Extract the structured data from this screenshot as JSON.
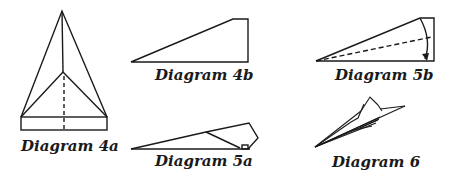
{
  "diagrams": [
    {
      "id": "4a",
      "caption": "Diagram 4a"
    },
    {
      "id": "4b",
      "caption": "Diagram 4b"
    },
    {
      "id": "5a",
      "caption": "Diagram 5a"
    },
    {
      "id": "5b",
      "caption": "Diagram 5b"
    },
    {
      "id": "6",
      "caption": "Diagram 6"
    }
  ],
  "colors": {
    "line": "#1a1a1a",
    "background": "#ffffff"
  }
}
